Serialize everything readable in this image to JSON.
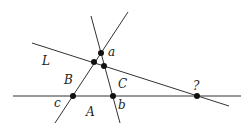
{
  "diagram": {
    "line_color": "#333333",
    "point_color": "#111111",
    "lines": [
      {
        "id": "horizontal",
        "x1": 13,
        "y1": 96,
        "x2": 241,
        "y2": 96
      },
      {
        "id": "L",
        "x1": 32,
        "y1": 43,
        "x2": 229,
        "y2": 106
      },
      {
        "id": "left-slant",
        "x1": 55,
        "y1": 123,
        "x2": 128,
        "y2": 12
      },
      {
        "id": "right-slant",
        "x1": 91,
        "y1": 16,
        "x2": 120,
        "y2": 123
      }
    ],
    "points": [
      {
        "id": "a",
        "x": 101,
        "y": 53
      },
      {
        "id": "left-mid",
        "x": 94,
        "y": 62
      },
      {
        "id": "right-mid",
        "x": 104,
        "y": 66
      },
      {
        "id": "c",
        "x": 73,
        "y": 96
      },
      {
        "id": "b",
        "x": 113,
        "y": 96
      },
      {
        "id": "q",
        "x": 197,
        "y": 96
      }
    ],
    "labels": {
      "a": "a",
      "L": "L",
      "B": "B",
      "C": "C",
      "c": "c",
      "b": "b",
      "A": "A",
      "q": "?"
    }
  }
}
